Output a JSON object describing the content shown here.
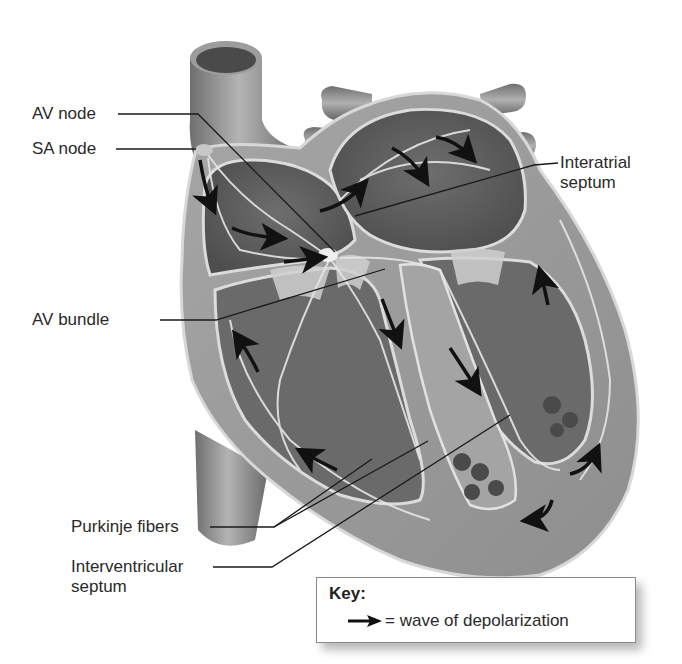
{
  "diagram": {
    "colors": {
      "myocardium": "#9a9a9a",
      "chamber_dark": "#5e5e5e",
      "vessel": "#8c8c8c",
      "conduction_fibers": "#e6e6e6",
      "arrow": "#111111",
      "leader_line": "#1a1a1a",
      "label_text": "#2a2a2a"
    },
    "labels": [
      {
        "id": "av-node",
        "text": "AV node"
      },
      {
        "id": "sa-node",
        "text": "SA node"
      },
      {
        "id": "interatrial-septum",
        "line1": "Interatrial",
        "line2": "septum"
      },
      {
        "id": "av-bundle",
        "text": "AV bundle"
      },
      {
        "id": "purkinje-fibers",
        "text": "Purkinje fibers"
      },
      {
        "id": "interventricular-septum",
        "line1": "Interventricular",
        "line2": "septum"
      }
    ],
    "key": {
      "title": "Key:",
      "arrow_icon": "right-arrow-icon",
      "description": "= wave of depolarization"
    }
  }
}
